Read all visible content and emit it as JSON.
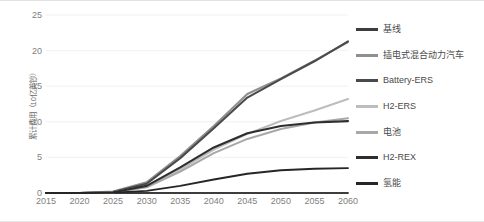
{
  "chart_data": {
    "type": "line",
    "title": "",
    "xlabel": "",
    "ylabel": "累计费用（10亿美钞）",
    "x": [
      2015,
      2020,
      2025,
      2030,
      2035,
      2040,
      2045,
      2050,
      2055,
      2060
    ],
    "xlim": [
      2015,
      2060
    ],
    "ylim": [
      0,
      25
    ],
    "yticks": [
      0,
      5,
      10,
      15,
      20,
      25
    ],
    "xticks": [
      "2015",
      "2020",
      "2025",
      "2030",
      "2035",
      "2040",
      "2045",
      "2050",
      "2055",
      "2060"
    ],
    "grid": true,
    "legend_position": "right",
    "series": [
      {
        "name": "基线",
        "color": "#3d3d3d",
        "width": 1.9,
        "values": [
          0,
          0,
          0,
          0,
          0,
          0,
          0,
          0,
          0,
          0
        ]
      },
      {
        "name": "插电式混合动力汽车",
        "color": "#8f8f8f",
        "width": 2.1,
        "values": [
          0,
          0,
          0.2,
          1.5,
          5.2,
          9.4,
          13.9,
          16.1,
          18.6,
          21.2
        ]
      },
      {
        "name": "Battery-ERS",
        "color": "#4a4a4a",
        "width": 2.1,
        "values": [
          0,
          0,
          0.15,
          1.3,
          4.9,
          9.1,
          13.4,
          16.0,
          18.5,
          21.3
        ]
      },
      {
        "name": "H2-ERS",
        "color": "#bdbdbd",
        "width": 2.1,
        "values": [
          0,
          0,
          0.1,
          0.9,
          3.3,
          6.1,
          8.3,
          10.1,
          11.6,
          13.2
        ]
      },
      {
        "name": "电池",
        "color": "#a8a8a8",
        "width": 2.1,
        "values": [
          0,
          0,
          0.1,
          0.8,
          3.0,
          5.6,
          7.6,
          9.0,
          9.9,
          10.5
        ]
      },
      {
        "name": "H2-REX",
        "color": "#2e2e2e",
        "width": 2.1,
        "values": [
          0,
          0,
          0.1,
          1.0,
          3.6,
          6.4,
          8.4,
          9.4,
          9.9,
          10.1
        ]
      },
      {
        "name": "氢能",
        "color": "#262626",
        "width": 1.9,
        "values": [
          0,
          0,
          0.05,
          0.3,
          1.0,
          1.9,
          2.7,
          3.2,
          3.4,
          3.5
        ]
      }
    ]
  },
  "legend": {
    "items": [
      {
        "label": "基线"
      },
      {
        "label": "插电式混合动力汽车"
      },
      {
        "label": "Battery-ERS"
      },
      {
        "label": "H2-ERS"
      },
      {
        "label": "电池"
      },
      {
        "label": "H2-REX"
      },
      {
        "label": "氢能"
      }
    ]
  },
  "colors": {
    "axis_text": "#808080",
    "legend_text": "#4a4a4a",
    "grid": "#eeeeee",
    "plot_background": "#ffffff"
  }
}
